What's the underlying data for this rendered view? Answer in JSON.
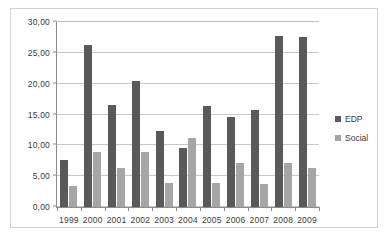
{
  "chart_data": {
    "type": "bar",
    "title": "",
    "xlabel": "",
    "ylabel": "",
    "ylim": [
      0,
      30
    ],
    "ytick_labels": [
      "0,00",
      "5,00",
      "10,00",
      "15,00",
      "20,00",
      "25,00",
      "30,00"
    ],
    "ytick_values": [
      0,
      5,
      10,
      15,
      20,
      25,
      30
    ],
    "grid": true,
    "legend_position": "right",
    "categories": [
      "1999",
      "2000",
      "2001",
      "2002",
      "2003",
      "2004",
      "2005",
      "2006",
      "2007",
      "2008",
      "2009"
    ],
    "series": [
      {
        "name": "EDP",
        "color": "#595959",
        "values": [
          7.7,
          26.3,
          16.5,
          20.4,
          12.3,
          9.5,
          16.3,
          14.6,
          15.8,
          27.8,
          27.5
        ]
      },
      {
        "name": "Social",
        "color": "#a6a6a6",
        "values": [
          3.4,
          9.0,
          6.3,
          8.9,
          3.9,
          11.2,
          3.9,
          7.2,
          3.7,
          7.1,
          6.3
        ]
      }
    ]
  },
  "legend": {
    "items": [
      {
        "label": "EDP",
        "color": "#595959",
        "swatch_name": "legend-swatch-edp"
      },
      {
        "label": "Social",
        "color": "#a6a6a6",
        "swatch_name": "legend-swatch-social"
      }
    ]
  },
  "colors": {
    "series_edp": "#595959",
    "series_social": "#a6a6a6",
    "gridline": "#c8c8c8",
    "axis": "#8c8c8c",
    "border": "#d2d2d2",
    "text": "#3a3a3a",
    "background": "#ffffff"
  }
}
